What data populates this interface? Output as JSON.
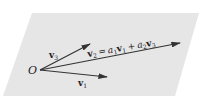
{
  "diagram": {
    "plane_color": "#e6e6e6",
    "vector_color": "#333333",
    "origin_label": "O",
    "vectors": [
      {
        "id": "v1",
        "label_base": "v",
        "label_sub": "1"
      },
      {
        "id": "v2",
        "label_base": "v",
        "label_sub": "2"
      },
      {
        "id": "v3",
        "label_base": "v",
        "label_sub": "3"
      }
    ],
    "equation": {
      "lhs_base": "v",
      "lhs_sub": "2",
      "equals": "=",
      "a1": "a",
      "a1_sub": "1",
      "t1_base": "v",
      "t1_sub": "1",
      "plus": "+",
      "a2": "a",
      "a2_sub": "2",
      "t2_base": "v",
      "t2_sub": "3"
    }
  }
}
